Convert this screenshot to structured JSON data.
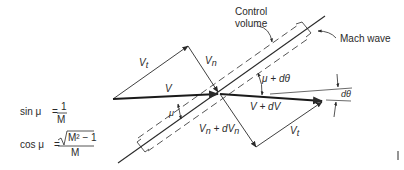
{
  "diagram": {
    "labels": {
      "control_volume_line1": "Control",
      "control_volume_line2": "volume",
      "mach_wave": "Mach wave",
      "v_t_upper": "V",
      "v_t_upper_sub": "t",
      "v_n": "V",
      "v_n_sub": "n",
      "v": "V",
      "mu": "μ",
      "mu_plus_dtheta": "μ + dθ",
      "v_plus_dv": "V + dV",
      "d_theta": "dθ",
      "v_n_plus_dv_n": "V",
      "v_n_plus_dv_n_sub1": "n",
      "v_n_plus_dv_n_mid": " + dV",
      "v_n_plus_dv_n_sub2": "n",
      "v_t_lower": "V",
      "v_t_lower_sub": "t"
    },
    "equations": {
      "sin_lhs": "sin μ",
      "sin_eq": "=",
      "sin_num": "1",
      "sin_den": "M",
      "cos_lhs": "cos μ",
      "cos_eq": "=",
      "cos_num": "M² − 1",
      "cos_den": "M"
    },
    "colors": {
      "ink": "#2a2a2a",
      "background": "#ffffff"
    }
  }
}
